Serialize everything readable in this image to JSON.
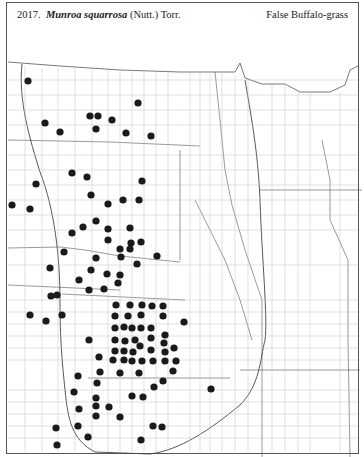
{
  "header": {
    "number": "2017.",
    "genus_species": "Munroa squarrosa",
    "authority": "(Nutt.) Torr.",
    "common_name": "False Buffalo-grass"
  },
  "map": {
    "description": "County dot distribution map of the Great Plains (ND, SD, NE, KS, OK, MN, IA, MO, AR, WI regions)",
    "dot_color": "#1a1a1a",
    "line_color": "#777777",
    "occurrences": [
      [
        28,
        81
      ],
      [
        45,
        123
      ],
      [
        60,
        132
      ],
      [
        90,
        116
      ],
      [
        98,
        116
      ],
      [
        112,
        120
      ],
      [
        96,
        129
      ],
      [
        138,
        103
      ],
      [
        126,
        133
      ],
      [
        151,
        136
      ],
      [
        72,
        173
      ],
      [
        87,
        177
      ],
      [
        36,
        184
      ],
      [
        12,
        205
      ],
      [
        30,
        209
      ],
      [
        142,
        181
      ],
      [
        91,
        195
      ],
      [
        108,
        204
      ],
      [
        123,
        200
      ],
      [
        139,
        200
      ],
      [
        96,
        221
      ],
      [
        83,
        227
      ],
      [
        108,
        229
      ],
      [
        130,
        228
      ],
      [
        72,
        233
      ],
      [
        108,
        240
      ],
      [
        131,
        243
      ],
      [
        141,
        242
      ],
      [
        120,
        249
      ],
      [
        130,
        249
      ],
      [
        157,
        256
      ],
      [
        64,
        252
      ],
      [
        96,
        258
      ],
      [
        121,
        257
      ],
      [
        137,
        264
      ],
      [
        50,
        268
      ],
      [
        91,
        270
      ],
      [
        79,
        280
      ],
      [
        107,
        274
      ],
      [
        120,
        275
      ],
      [
        89,
        290
      ],
      [
        104,
        289
      ],
      [
        118,
        283
      ],
      [
        57,
        295
      ],
      [
        51,
        296
      ],
      [
        30,
        315
      ],
      [
        46,
        321
      ],
      [
        62,
        315
      ],
      [
        116,
        305
      ],
      [
        130,
        305
      ],
      [
        142,
        305
      ],
      [
        152,
        306
      ],
      [
        163,
        306
      ],
      [
        115,
        316
      ],
      [
        128,
        316
      ],
      [
        141,
        315
      ],
      [
        163,
        316
      ],
      [
        115,
        328
      ],
      [
        124,
        327
      ],
      [
        132,
        328
      ],
      [
        141,
        328
      ],
      [
        151,
        328
      ],
      [
        89,
        340
      ],
      [
        115,
        340
      ],
      [
        125,
        341
      ],
      [
        135,
        340
      ],
      [
        151,
        338
      ],
      [
        165,
        335
      ],
      [
        140,
        346
      ],
      [
        164,
        343
      ],
      [
        115,
        351
      ],
      [
        124,
        351
      ],
      [
        133,
        352
      ],
      [
        151,
        350
      ],
      [
        165,
        352
      ],
      [
        174,
        348
      ],
      [
        99,
        357
      ],
      [
        113,
        360
      ],
      [
        124,
        360
      ],
      [
        132,
        361
      ],
      [
        142,
        361
      ],
      [
        153,
        361
      ],
      [
        165,
        361
      ],
      [
        176,
        361
      ],
      [
        173,
        371
      ],
      [
        100,
        372
      ],
      [
        120,
        373
      ],
      [
        139,
        373
      ],
      [
        78,
        376
      ],
      [
        97,
        383
      ],
      [
        163,
        381
      ],
      [
        154,
        387
      ],
      [
        74,
        392
      ],
      [
        96,
        398
      ],
      [
        132,
        396
      ],
      [
        143,
        397
      ],
      [
        79,
        409
      ],
      [
        96,
        406
      ],
      [
        109,
        407
      ],
      [
        96,
        416
      ],
      [
        120,
        417
      ],
      [
        78,
        426
      ],
      [
        56,
        428
      ],
      [
        88,
        437
      ],
      [
        57,
        445
      ],
      [
        141,
        440
      ],
      [
        153,
        426
      ],
      [
        162,
        427
      ],
      [
        184,
        322
      ],
      [
        211,
        389
      ]
    ]
  }
}
